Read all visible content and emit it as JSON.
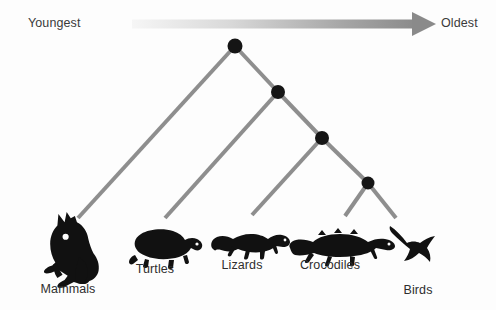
{
  "figure": {
    "type": "phylogenetic-tree",
    "background_color": "#fdfdfd"
  },
  "axis": {
    "left_label": "Youngest",
    "right_label": "Oldest",
    "arrow": {
      "name": "time-arrow",
      "direction": "right",
      "gradient_from": "#f4f4f4",
      "gradient_to": "#8c8c8c",
      "x_start": 132,
      "x_end": 433,
      "y": 24,
      "thickness": 9
    }
  },
  "tree": {
    "branch_color": "#8e8e8e",
    "branch_width": 4,
    "node_color": "#151515",
    "node_radius": 7,
    "nodes": [
      {
        "id": "root",
        "label": "root-node",
        "x": 235,
        "y": 46
      },
      {
        "id": "node2",
        "label": "node-2",
        "x": 278,
        "y": 92
      },
      {
        "id": "node3",
        "label": "node-3",
        "x": 322,
        "y": 138
      },
      {
        "id": "node4",
        "label": "node-4",
        "x": 368,
        "y": 183
      }
    ],
    "branches": [
      {
        "name": "branch-root-to-mammals",
        "x1": 235,
        "y1": 46,
        "x2": 78,
        "y2": 218
      },
      {
        "name": "branch-root-to-node2",
        "x1": 235,
        "y1": 46,
        "x2": 278,
        "y2": 92
      },
      {
        "name": "branch-node2-to-turtles",
        "x1": 278,
        "y1": 92,
        "x2": 165,
        "y2": 218
      },
      {
        "name": "branch-node2-to-node3",
        "x1": 278,
        "y1": 92,
        "x2": 322,
        "y2": 138
      },
      {
        "name": "branch-node3-to-lizards",
        "x1": 322,
        "y1": 138,
        "x2": 252,
        "y2": 215
      },
      {
        "name": "branch-node3-to-node4",
        "x1": 322,
        "y1": 138,
        "x2": 368,
        "y2": 183
      },
      {
        "name": "branch-node4-to-crocodiles",
        "x1": 368,
        "y1": 183,
        "x2": 345,
        "y2": 216
      },
      {
        "name": "branch-node4-to-birds",
        "x1": 368,
        "y1": 183,
        "x2": 396,
        "y2": 218
      }
    ]
  },
  "taxa": [
    {
      "id": "mammals",
      "label": "Mammals",
      "icon": "kangaroo-silhouette",
      "label_x": 68,
      "label_y": 282,
      "silhouette_color": "#111111"
    },
    {
      "id": "turtles",
      "label": "Turtles",
      "icon": "turtle-silhouette",
      "label_x": 155,
      "label_y": 262,
      "silhouette_color": "#111111"
    },
    {
      "id": "lizards",
      "label": "Lizards",
      "icon": "lizard-silhouette",
      "label_x": 242,
      "label_y": 258,
      "silhouette_color": "#111111"
    },
    {
      "id": "crocodiles",
      "label": "Crocodiles",
      "icon": "crocodile-silhouette",
      "label_x": 330,
      "label_y": 258,
      "silhouette_color": "#111111"
    },
    {
      "id": "birds",
      "label": "Birds",
      "icon": "bird-silhouette",
      "label_x": 418,
      "label_y": 283,
      "silhouette_color": "#111111"
    }
  ]
}
